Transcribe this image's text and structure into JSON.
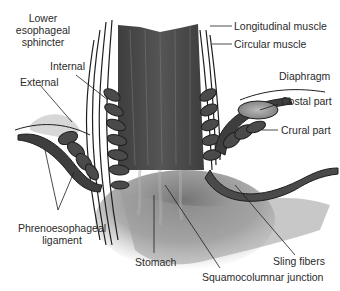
{
  "diagram": {
    "labels": {
      "les_line1": "Lower",
      "les_line2": "esophageal",
      "les_line3": "sphincter",
      "internal": "Internal",
      "external": "External",
      "phreno_line1": "Phrenoesophageal",
      "phreno_line2": "ligament",
      "stomach": "Stomach",
      "squamocolumnar": "Squamocolumnar junction",
      "sling": "Sling fibers",
      "longitudinal": "Longitudinal muscle",
      "circular": "Circular muscle",
      "diaphragm": "Diaphragm",
      "costal": "Costal part",
      "crural": "Crural part"
    },
    "colors": {
      "background": "#ffffff",
      "muscle_dark": "#4a4a4a",
      "muscle_mid": "#6b6b6b",
      "stomach_fade": "#8a8a8a",
      "outline": "#1e1e1e",
      "text": "#2a2a2a"
    }
  }
}
